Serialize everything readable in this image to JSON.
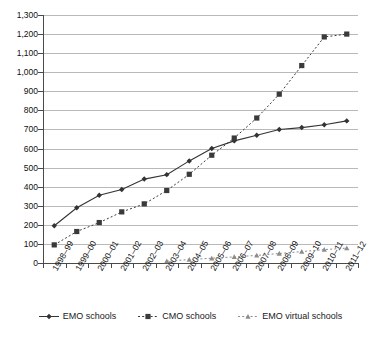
{
  "chart_data": {
    "type": "line",
    "title": "",
    "subtitle": "",
    "xlabel": "",
    "ylabel": "",
    "ylim": [
      0,
      1300
    ],
    "ytick_step": 100,
    "grid": true,
    "legend_position": "bottom",
    "categories": [
      "1998–99",
      "1999–00",
      "2000–01",
      "2001–02",
      "2002–03",
      "2003–04",
      "2004–05",
      "2005–06",
      "2006–07",
      "2007–08",
      "2008–09",
      "2009–10",
      "2010–11",
      "2011–12"
    ],
    "ytick_labels": [
      "0",
      "100",
      "200",
      "300",
      "400",
      "500",
      "600",
      "700",
      "800",
      "900",
      "1,000",
      "1,100",
      "1,200",
      "1,300"
    ],
    "series": [
      {
        "name": "EMO schools",
        "marker": "diamond",
        "line_style": "solid",
        "color": "#333333",
        "values": [
          195,
          290,
          355,
          385,
          440,
          463,
          535,
          600,
          640,
          670,
          700,
          710,
          725,
          745
        ]
      },
      {
        "name": "CMO schools",
        "marker": "square",
        "line_style": "dotted",
        "color": "#3a3a3a",
        "values": [
          95,
          165,
          212,
          268,
          310,
          380,
          465,
          565,
          655,
          760,
          885,
          1035,
          1185,
          1200
        ]
      },
      {
        "name": "EMO virtual schools",
        "marker": "triangle",
        "line_style": "dotted",
        "color": "#8c8c8c",
        "values": [
          null,
          null,
          null,
          null,
          null,
          10,
          18,
          25,
          32,
          40,
          50,
          60,
          70,
          78
        ]
      }
    ]
  },
  "legend": {
    "items": [
      {
        "label": "EMO schools"
      },
      {
        "label": "CMO schools"
      },
      {
        "label": "EMO virtual schools"
      }
    ]
  }
}
